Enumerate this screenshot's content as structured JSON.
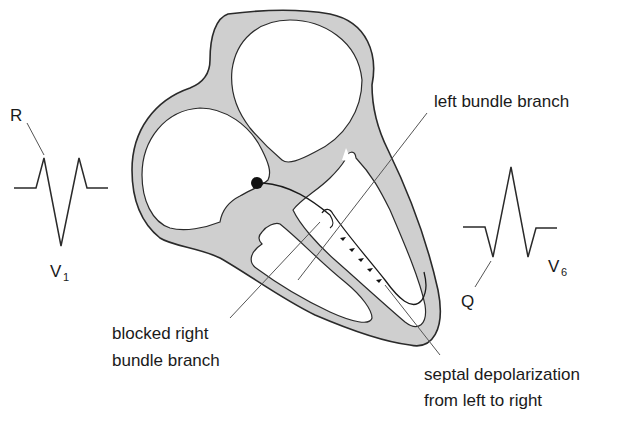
{
  "diagram": {
    "colors": {
      "background": "#ffffff",
      "myocardium": "#cfcfcf",
      "outline": "#2a2a2a",
      "leader_line": "#555555",
      "text": "#1a1a1a"
    },
    "labels": {
      "left_bundle_branch": "left bundle branch",
      "blocked_right_line1": "blocked right",
      "blocked_right_line2": "bundle branch",
      "septal_line1": "septal depolarization",
      "septal_line2": "from left to right",
      "v1_lead": "V",
      "v1_sub": "1",
      "v6_lead": "V",
      "v6_sub": "6",
      "r_wave": "R",
      "q_wave": "Q"
    },
    "ecg_traces": [
      {
        "lead": "V1",
        "feature": "R",
        "shape": "small r, deep S, secondary r"
      },
      {
        "lead": "V6",
        "feature": "Q",
        "shape": "small q, tall R, S"
      }
    ],
    "septal_arrows_count": 5
  }
}
